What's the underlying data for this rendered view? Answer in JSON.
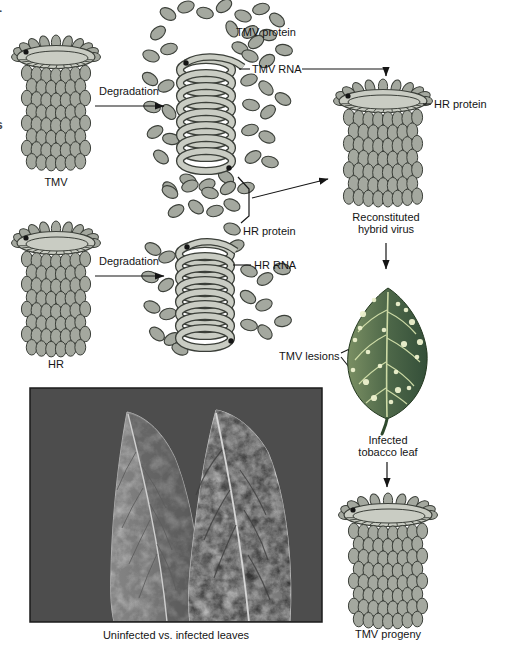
{
  "figure": {
    "tmv_row": {
      "virus_label": "TMV",
      "degradation_label": "Degradation",
      "protein_label": "TMV protein",
      "rna_label": "TMV RNA"
    },
    "hr_row": {
      "virus_label": "HR",
      "degradation_label": "Degradation",
      "protein_label": "HR protein",
      "rna_label": "HR RNA"
    },
    "hybrid": {
      "coat_label": "HR protein",
      "caption_line1": "Reconstituted",
      "caption_line2": "hybrid virus"
    },
    "infection": {
      "lesions_label": "TMV lesions",
      "caption_line1": "Infected",
      "caption_line2": "tobacco leaf"
    },
    "progeny": {
      "caption": "TMV progeny"
    },
    "photo": {
      "caption": "Uninfected vs. infected leaves"
    },
    "edge_artifacts": {
      "top": "-",
      "bottom": "s"
    }
  },
  "colors": {
    "subunit": "#a4a89f",
    "outline": "#3b3f39",
    "disc": "#c9ccc3",
    "coil": "#c9ccc3",
    "ink": "#151515",
    "leaf_light": "#7a8f63",
    "leaf_mid": "#4e6849",
    "leaf_dark": "#344f39",
    "leaf_vein": "#dbe7b0",
    "lesion": "#eef2cf",
    "photo_bg": "#4d4d4d",
    "photo_leaf_left": "#a6a6a6",
    "photo_leaf_right": "#8f8f8f",
    "background": "#ffffff"
  }
}
